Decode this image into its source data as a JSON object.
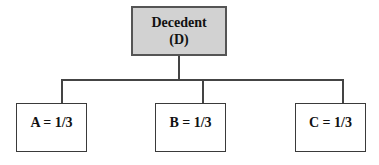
{
  "diagram": {
    "type": "tree",
    "root": {
      "label_line1": "Decedent",
      "label_line2": "(D)",
      "fill": "#d2d2d2"
    },
    "children": [
      {
        "label": "A = 1/3"
      },
      {
        "label": "B = 1/3"
      },
      {
        "label": "C = 1/3"
      }
    ],
    "edges": [
      {
        "from": "Decedent (D)",
        "to": "A = 1/3"
      },
      {
        "from": "Decedent (D)",
        "to": "B = 1/3"
      },
      {
        "from": "Decedent (D)",
        "to": "C = 1/3"
      }
    ]
  }
}
